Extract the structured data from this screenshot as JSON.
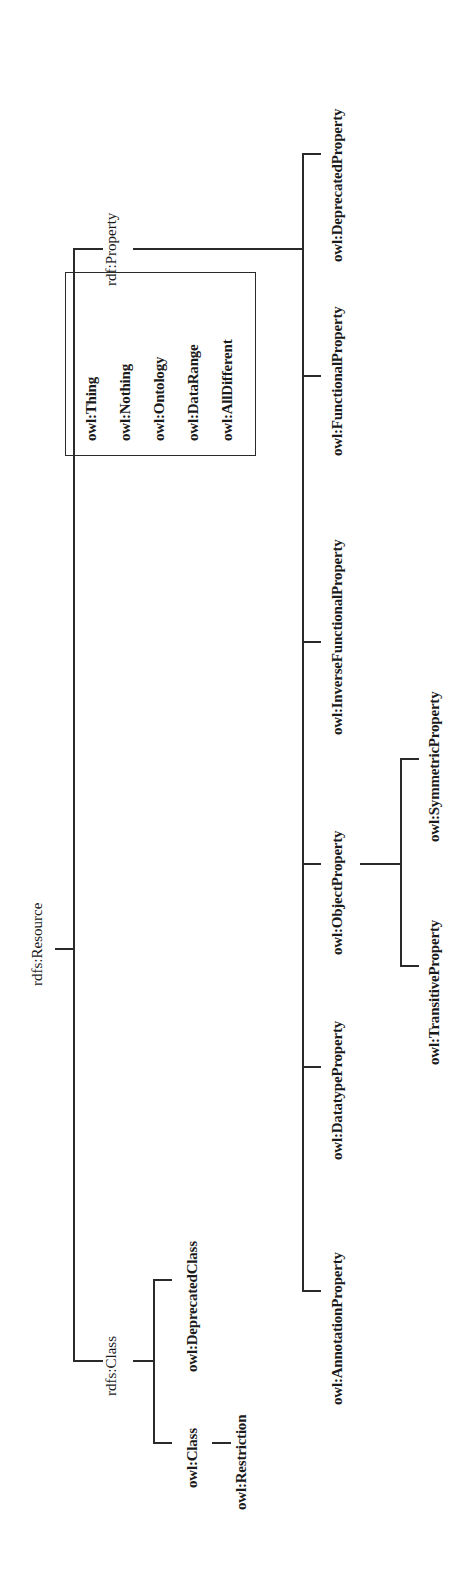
{
  "diagram": {
    "type": "tree",
    "orientation": "rotated-90-ccw",
    "root": {
      "label": "rdfs:Resource"
    },
    "branches": {
      "class": {
        "label": "rdfs:Class",
        "children": {
          "owl_class": {
            "label": "owl:Class",
            "children": [
              {
                "label": "owl:Restriction"
              }
            ]
          },
          "deprecated_class": {
            "label": "owl:DeprecatedClass"
          }
        }
      },
      "property": {
        "label": "rdf:Property",
        "children": {
          "annotation": {
            "label": "owl:AnnotationProperty"
          },
          "datatype": {
            "label": "owl:DatatypeProperty"
          },
          "object": {
            "label": "owl:ObjectProperty",
            "children": {
              "transitive": {
                "label": "owl:TransitiveProperty"
              },
              "symmetric": {
                "label": "owl:SymmetricProperty"
              }
            }
          },
          "inverse_functional": {
            "label": "owl:InverseFunctionalProperty"
          },
          "functional": {
            "label": "owl:FunctionalProperty"
          },
          "deprecated": {
            "label": "owl:DeprecatedProperty"
          }
        }
      }
    },
    "standalone_box": {
      "items": [
        "owl:Thing",
        "owl:Nothing",
        "owl:Ontology",
        "owl:DataRange",
        "owl:AllDifferent"
      ]
    }
  }
}
